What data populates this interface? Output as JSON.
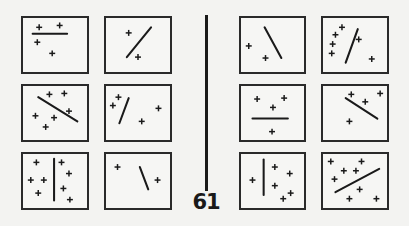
{
  "figure": {
    "problem_number": "61",
    "line_color": "#1a1a1a",
    "border_color": "#2a2a2a",
    "background": "#f3f3f1"
  },
  "panels": [
    {
      "side": "left",
      "row": 0,
      "col": 0,
      "x": 21,
      "y": 16,
      "w": 68,
      "h": 58,
      "line": [
        10,
        17,
        47,
        17
      ],
      "crosses": [
        [
          17,
          10
        ],
        [
          39,
          8
        ],
        [
          15,
          26
        ],
        [
          31,
          38
        ]
      ]
    },
    {
      "side": "left",
      "row": 0,
      "col": 1,
      "x": 104,
      "y": 16,
      "w": 68,
      "h": 58,
      "line": [
        48,
        10,
        22,
        42
      ],
      "crosses": [
        [
          24,
          16
        ],
        [
          34,
          42
        ]
      ]
    },
    {
      "side": "left",
      "row": 1,
      "col": 0,
      "x": 21,
      "y": 84,
      "w": 68,
      "h": 58,
      "line": [
        16,
        12,
        58,
        38
      ],
      "crosses": [
        [
          28,
          9
        ],
        [
          44,
          8
        ],
        [
          49,
          27
        ],
        [
          13,
          32
        ],
        [
          33,
          34
        ],
        [
          24,
          44
        ]
      ]
    },
    {
      "side": "left",
      "row": 1,
      "col": 1,
      "x": 104,
      "y": 84,
      "w": 68,
      "h": 58,
      "line": [
        24,
        13,
        14,
        40
      ],
      "crosses": [
        [
          13,
          12
        ],
        [
          7,
          21
        ],
        [
          56,
          24
        ],
        [
          38,
          38
        ]
      ]
    },
    {
      "side": "left",
      "row": 2,
      "col": 0,
      "x": 21,
      "y": 152,
      "w": 68,
      "h": 58,
      "line": [
        33,
        5,
        33,
        50
      ],
      "crosses": [
        [
          14,
          9
        ],
        [
          41,
          9
        ],
        [
          49,
          21
        ],
        [
          8,
          28
        ],
        [
          22,
          28
        ],
        [
          43,
          37
        ],
        [
          16,
          42
        ],
        [
          50,
          49
        ]
      ]
    },
    {
      "side": "left",
      "row": 2,
      "col": 1,
      "x": 104,
      "y": 152,
      "w": 68,
      "h": 58,
      "line": [
        36,
        14,
        45,
        38
      ],
      "crosses": [
        [
          12,
          14
        ],
        [
          55,
          28
        ]
      ]
    },
    {
      "side": "right",
      "row": 0,
      "col": 0,
      "x": 239,
      "y": 16,
      "w": 67,
      "h": 58,
      "line": [
        25,
        10,
        43,
        43
      ],
      "crosses": [
        [
          8,
          30
        ],
        [
          26,
          43
        ]
      ]
    },
    {
      "side": "right",
      "row": 0,
      "col": 1,
      "x": 321,
      "y": 16,
      "w": 68,
      "h": 58,
      "line": [
        37,
        12,
        24,
        48
      ],
      "crosses": [
        [
          20,
          10
        ],
        [
          13,
          18
        ],
        [
          10,
          28
        ],
        [
          9,
          38
        ],
        [
          38,
          23
        ],
        [
          52,
          44
        ]
      ]
    },
    {
      "side": "right",
      "row": 1,
      "col": 0,
      "x": 239,
      "y": 84,
      "w": 67,
      "h": 58,
      "line": [
        12,
        35,
        50,
        35
      ],
      "crosses": [
        [
          17,
          14
        ],
        [
          46,
          13
        ],
        [
          34,
          23
        ],
        [
          33,
          49
        ]
      ]
    },
    {
      "side": "right",
      "row": 1,
      "col": 1,
      "x": 321,
      "y": 84,
      "w": 68,
      "h": 58,
      "line": [
        24,
        13,
        58,
        35
      ],
      "crosses": [
        [
          30,
          9
        ],
        [
          45,
          17
        ],
        [
          61,
          8
        ],
        [
          28,
          38
        ]
      ]
    },
    {
      "side": "right",
      "row": 2,
      "col": 0,
      "x": 239,
      "y": 152,
      "w": 67,
      "h": 58,
      "line": [
        24,
        6,
        24,
        44
      ],
      "crosses": [
        [
          12,
          28
        ],
        [
          36,
          14
        ],
        [
          52,
          21
        ],
        [
          36,
          34
        ],
        [
          45,
          48
        ],
        [
          53,
          42
        ]
      ]
    },
    {
      "side": "right",
      "row": 2,
      "col": 1,
      "x": 321,
      "y": 152,
      "w": 68,
      "h": 58,
      "line": [
        60,
        16,
        13,
        41
      ],
      "crosses": [
        [
          8,
          8
        ],
        [
          41,
          8
        ],
        [
          22,
          18
        ],
        [
          35,
          18
        ],
        [
          12,
          27
        ],
        [
          39,
          38
        ],
        [
          28,
          48
        ],
        [
          57,
          48
        ]
      ]
    }
  ]
}
